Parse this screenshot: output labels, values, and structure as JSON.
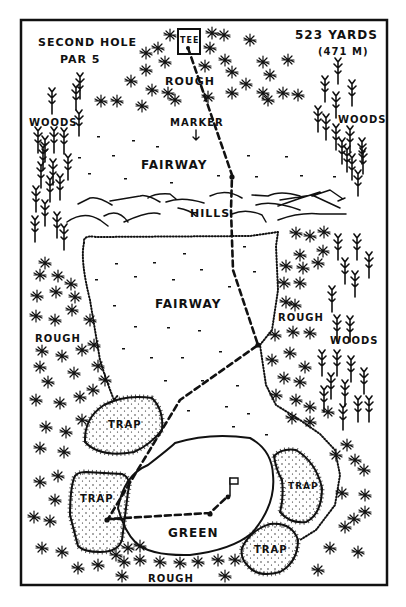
{
  "hole": {
    "title": "SECOND HOLE",
    "par": "PAR 5",
    "distance_yards": "523 YARDS",
    "distance_meters": "(471 M)"
  },
  "labels": {
    "tee": "TEE",
    "rough_top": "ROUGH",
    "marker": "MARKER",
    "woods_left": "WOODS",
    "woods_right_top": "WOODS",
    "fairway_upper": "FAIRWAY",
    "hills": "HILLS",
    "fairway_lower": "FAIRWAY",
    "rough_left": "ROUGH",
    "rough_right": "ROUGH",
    "woods_right_mid": "WOODS",
    "trap_upper_left": "TRAP",
    "trap_left": "TRAP",
    "trap_right": "TRAP",
    "trap_bottom_right": "TRAP",
    "green": "GREEN",
    "rough_bottom": "ROUGH"
  },
  "colors": {
    "ink": "#111111",
    "paper": "#ffffff"
  }
}
